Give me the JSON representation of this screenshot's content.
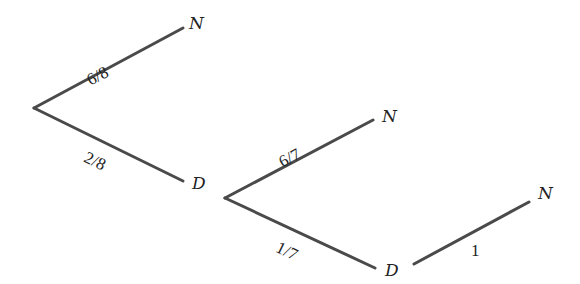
{
  "diagram": {
    "type": "probability-tree",
    "stages": [
      {
        "branches": [
          {
            "label": "6/8",
            "outcome": "N"
          },
          {
            "label": "2/8",
            "outcome": "D"
          }
        ]
      },
      {
        "parent_outcome": "D",
        "branches": [
          {
            "label": "6/7",
            "outcome": "N"
          },
          {
            "label": "1/7",
            "outcome": "D"
          }
        ]
      },
      {
        "parent_outcome": "D",
        "branches": [
          {
            "label": "1",
            "outcome": "N"
          }
        ]
      }
    ]
  }
}
